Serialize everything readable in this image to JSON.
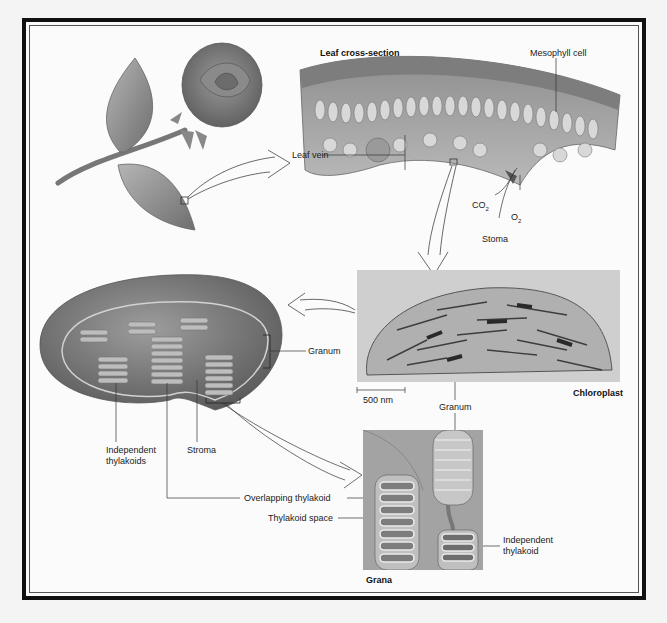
{
  "figure": {
    "sections": {
      "leaf_cross_section": {
        "title": "Leaf cross-section",
        "labels": {
          "mesophyll_cell": "Mesophyll cell",
          "leaf_vein": "Leaf vein",
          "co2": "CO",
          "co2_sub": "2",
          "o2": "O",
          "o2_sub": "2",
          "stoma": "Stoma"
        }
      },
      "micrograph": {
        "title": "Chloroplast",
        "scale_bar": "500 nm",
        "labels": {
          "granum": "Granum"
        }
      },
      "chloroplast_diagram": {
        "labels": {
          "granum": "Granum",
          "independent_thylakoids_line1": "Independent",
          "independent_thylakoids_line2": "thylakoids",
          "stroma": "Stroma"
        }
      },
      "grana": {
        "title": "Grana",
        "labels": {
          "overlapping_thylakoid": "Overlapping thylakoid",
          "thylakoid_space": "Thylakoid space",
          "independent_thylakoid_line1": "Independent",
          "independent_thylakoid_line2": "thylakoid"
        }
      }
    },
    "colors": {
      "frame": "#111111",
      "background": "#fbfbfb",
      "illustration_gray": "#8a8a8a",
      "label_text": "#222222"
    }
  }
}
